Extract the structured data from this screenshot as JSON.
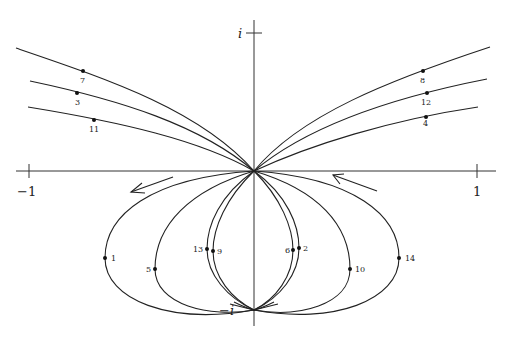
{
  "figure": {
    "axes": {
      "real_min_label": "−1",
      "real_max_label": "1",
      "imag_max_label": "i",
      "imag_min_label": "−i"
    },
    "upper_points": [
      {
        "label": "7",
        "side": "left"
      },
      {
        "label": "3",
        "side": "left"
      },
      {
        "label": "11",
        "side": "left"
      },
      {
        "label": "8",
        "side": "right"
      },
      {
        "label": "12",
        "side": "right"
      },
      {
        "label": "4",
        "side": "right"
      }
    ],
    "lower_points": [
      {
        "label": "1"
      },
      {
        "label": "5"
      },
      {
        "label": "13"
      },
      {
        "label": "9"
      },
      {
        "label": "6"
      },
      {
        "label": "2"
      },
      {
        "label": "10"
      },
      {
        "label": "14"
      }
    ],
    "arrows": [
      {
        "direction": "left-down",
        "position": "left of origin"
      },
      {
        "direction": "left-up",
        "position": "right of origin"
      }
    ],
    "colors": {
      "ink": "#222222",
      "background": "#ffffff"
    }
  }
}
